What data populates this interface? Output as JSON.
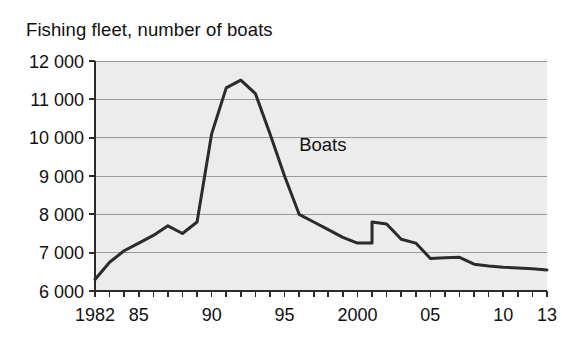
{
  "chart_data": {
    "type": "line",
    "title": "Fishing fleet, number of boats",
    "xlabel": "",
    "ylabel": "",
    "ylim": [
      6000,
      12000
    ],
    "xlim": [
      1982,
      2013
    ],
    "grid": true,
    "legend_position": "inline-annotation",
    "y_tick_step": 1000,
    "y_tick_labels": [
      "12 000",
      "11 000",
      "10 000",
      "9 000",
      "8 000",
      "7 000",
      "6 000"
    ],
    "y_tick_values": [
      12000,
      11000,
      10000,
      9000,
      8000,
      7000,
      6000
    ],
    "x_tick_labels": [
      "1982",
      "85",
      "90",
      "95",
      "2000",
      "05",
      "10",
      "13"
    ],
    "x_tick_values": [
      1982,
      1985,
      1990,
      1995,
      2000,
      2005,
      2010,
      2013
    ],
    "x_minor_tick_values": [
      1982,
      1983,
      1984,
      1985,
      1986,
      1987,
      1988,
      1989,
      1990,
      1991,
      1992,
      1993,
      1994,
      1995,
      1996,
      1997,
      1998,
      1999,
      2000,
      2001,
      2002,
      2003,
      2004,
      2005,
      2006,
      2007,
      2008,
      2009,
      2010,
      2011,
      2012,
      2013
    ],
    "annotations": [
      {
        "text": "Boats",
        "x": 1996.0,
        "y": 9650
      }
    ],
    "series": [
      {
        "name": "Boats",
        "color": "#2b2b2b",
        "x": [
          1982,
          1983,
          1984,
          1985,
          1986,
          1987,
          1988,
          1989,
          1990,
          1991,
          1992,
          1993,
          1994,
          1995,
          1996,
          1997,
          1998,
          1999,
          2000,
          2001,
          2001,
          2002,
          2003,
          2004,
          2005,
          2006,
          2007,
          2008,
          2009,
          2010,
          2011,
          2012,
          2013
        ],
        "values": [
          6300,
          6750,
          7050,
          7250,
          7450,
          7700,
          7500,
          7800,
          10100,
          11300,
          11500,
          11150,
          10100,
          9000,
          8000,
          7800,
          7600,
          7400,
          7250,
          7250,
          7800,
          7750,
          7350,
          7250,
          6850,
          6870,
          6880,
          6700,
          6650,
          6620,
          6600,
          6580,
          6550
        ]
      }
    ]
  },
  "style": {
    "plot_background": "#ececec",
    "grid_color": "#9a9a9a",
    "axis_color": "#2b2b2b",
    "line_color": "#2b2b2b",
    "page_background": "#ffffff",
    "text_color": "#111111"
  },
  "geometry": {
    "plot_left": 95,
    "plot_right": 547,
    "plot_top": 61,
    "plot_bottom": 291,
    "tick_length": 6,
    "line_width": 3
  }
}
